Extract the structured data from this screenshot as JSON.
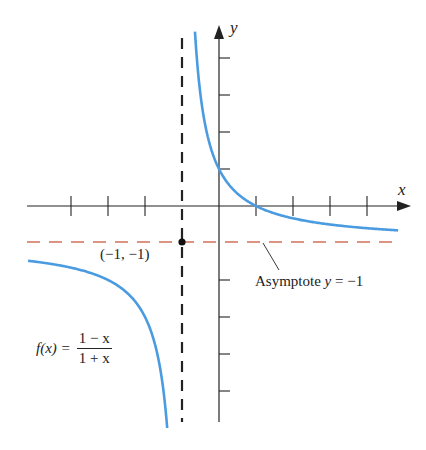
{
  "chart_data": {
    "type": "line",
    "title": "",
    "function": "f(x) = (1 - x)/(1 + x)",
    "xlabel": "x",
    "ylabel": "y",
    "xlim": [
      -5.2,
      5.1
    ],
    "ylim": [
      -5.8,
      4.9
    ],
    "grid": false,
    "legend": null,
    "x_ticks": [
      -4,
      -3,
      -2,
      -1,
      1,
      2,
      3,
      4
    ],
    "y_ticks": [
      -5,
      -4,
      -3,
      -2,
      -1,
      1,
      2,
      3,
      4
    ],
    "series": [
      {
        "name": "f(x) left branch",
        "color": "#4a9be0",
        "x": [
          -5.16,
          -4,
          -3,
          -2,
          -1.6,
          -1.4
        ],
        "y": [
          -1.48,
          -1.67,
          -2.0,
          -3.0,
          -4.33,
          -6.0
        ]
      },
      {
        "name": "f(x) right branch",
        "color": "#4a9be0",
        "x": [
          -0.65,
          -0.5,
          0,
          0.5,
          1,
          2,
          3,
          4,
          4.84
        ],
        "y": [
          4.71,
          3.0,
          1.0,
          0.33,
          0.0,
          -0.33,
          -0.5,
          -0.6,
          -0.66
        ]
      }
    ],
    "asymptotes": [
      {
        "type": "vertical",
        "x": -1,
        "color": "#222222",
        "style": "dashed"
      },
      {
        "type": "horizontal",
        "y": -1,
        "color": "#d0705a",
        "style": "dashed"
      }
    ],
    "points": [
      {
        "x": -1,
        "y": -1,
        "label": "(−1, −1)"
      }
    ],
    "annotations": [
      {
        "text": "Asymptote y = −1",
        "target": "horizontal asymptote"
      },
      {
        "text": "f(x) = (1 − x)/(1 + x)",
        "target": "left branch"
      }
    ]
  },
  "labels": {
    "x_axis": "x",
    "y_axis": "y",
    "point": "(−1, −1)",
    "asymptote_prefix": "Asymptote ",
    "asymptote_var": "y",
    "asymptote_eq": " = −1",
    "func_lhs": "f(x) =",
    "func_num": "1 − x",
    "func_den": "1 + x"
  },
  "colors": {
    "curve": "#4a9be0",
    "axis": "#222222",
    "h_asymptote": "#d0705a",
    "v_asymptote": "#222222"
  }
}
